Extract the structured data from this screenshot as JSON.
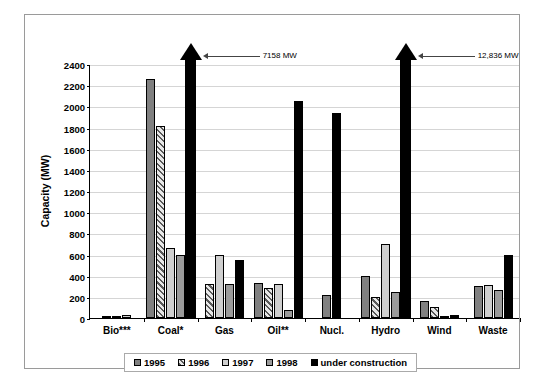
{
  "chart_data": {
    "type": "bar",
    "title": "",
    "xlabel": "",
    "ylabel": "Capacity (MW)",
    "ylim": [
      0,
      2400
    ],
    "ytick_step": 200,
    "yticks": [
      "2400",
      "2200",
      "2000",
      "1800",
      "1600",
      "1400",
      "1200",
      "1000",
      "800",
      "600",
      "400",
      "200",
      "0"
    ],
    "grid": true,
    "legend_position": "bottom",
    "categories": [
      "Bio***",
      "Coal*",
      "Gas",
      "Oil**",
      "Nucl.",
      "Hydro",
      "Wind",
      "Waste"
    ],
    "series": [
      {
        "name": "1995",
        "values": [
          10,
          2260,
          0,
          330,
          220,
          400,
          160,
          300
        ]
      },
      {
        "name": "1996",
        "values": [
          12,
          1810,
          320,
          280,
          0,
          200,
          100,
          0
        ]
      },
      {
        "name": "1997",
        "values": [
          28,
          660,
          600,
          320,
          0,
          700,
          20,
          310
        ]
      },
      {
        "name": "1998",
        "values": [
          0,
          600,
          320,
          80,
          0,
          250,
          0,
          260
        ]
      },
      {
        "name": "under construction",
        "values": [
          0,
          7158,
          550,
          2050,
          1940,
          12836,
          30,
          600
        ]
      }
    ],
    "annotations": [
      {
        "label": "7158 MW",
        "category": "Coal*",
        "series": "under construction"
      },
      {
        "label": "12,836 MW",
        "category": "Hydro",
        "series": "under construction"
      }
    ]
  },
  "legend": {
    "items": [
      {
        "label": "1995",
        "swatch": "dark-gray"
      },
      {
        "label": "1996",
        "swatch": "hatched"
      },
      {
        "label": "1997",
        "swatch": "light-gray"
      },
      {
        "label": "1998",
        "swatch": "mid-gray"
      },
      {
        "label": "under construction",
        "swatch": "black"
      }
    ]
  },
  "colors": {
    "series_1995": "#808080",
    "series_1996": "#c9c9c9",
    "series_1997": "#cfcfcf",
    "series_1998": "#9b9b9b",
    "series_under_construction": "#000000",
    "grid": "#d5d5d5",
    "axis": "#000000",
    "frame": "#9a9a9a"
  }
}
